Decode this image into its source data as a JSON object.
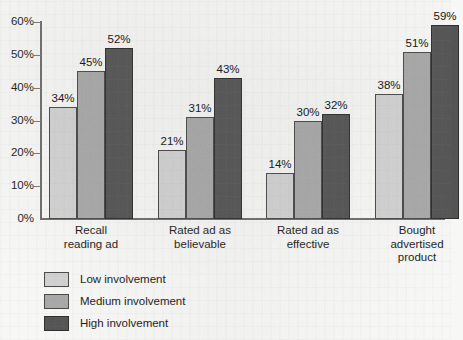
{
  "chart_data": {
    "type": "bar",
    "title": "",
    "subtitle": "",
    "xlabel": "",
    "ylabel": "",
    "ylim": [
      0,
      60
    ],
    "ytick_labels": [
      "0%",
      "10%",
      "20%",
      "30%",
      "40%",
      "50%",
      "60%"
    ],
    "ytick_values": [
      0,
      10,
      20,
      30,
      40,
      50,
      60
    ],
    "grid": false,
    "legend_position": "bottom-left",
    "value_suffix": "%",
    "categories": [
      "Recall reading ad",
      "Rated ad as believable",
      "Rated ad as effective",
      "Bought advertised product"
    ],
    "category_lines": [
      [
        "Recall",
        "reading ad"
      ],
      [
        "Rated ad as",
        "believable"
      ],
      [
        "Rated ad as",
        "effective"
      ],
      [
        "Bought",
        "advertised",
        "product"
      ]
    ],
    "series": [
      {
        "name": "Low involvement",
        "color": "#d2d2d2",
        "values": [
          34,
          21,
          14,
          38
        ],
        "labels": [
          "34%",
          "21%",
          "14%",
          "38%"
        ]
      },
      {
        "name": "Medium involvement",
        "color": "#a9a9a9",
        "values": [
          45,
          31,
          30,
          51
        ],
        "labels": [
          "45%",
          "31%",
          "30%",
          "51%"
        ]
      },
      {
        "name": "High involvement",
        "color": "#555555",
        "values": [
          52,
          43,
          32,
          59
        ],
        "labels": [
          "52%",
          "43%",
          "32%",
          "59%"
        ]
      }
    ]
  },
  "legend": {
    "items": [
      {
        "label": "Low involvement",
        "swatch": "low"
      },
      {
        "label": "Medium involvement",
        "swatch": "medium"
      },
      {
        "label": "High involvement",
        "swatch": "high"
      }
    ]
  }
}
